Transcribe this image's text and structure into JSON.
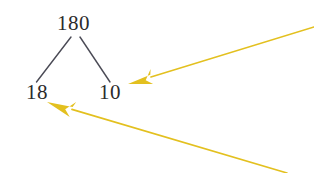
{
  "figure": {
    "kind": "factor-tree-with-annotation-arrows",
    "background_color": "#ffffff",
    "tree": {
      "root": {
        "value": "180",
        "name": "root-node"
      },
      "children": [
        {
          "value": "18",
          "name": "left-child-node"
        },
        {
          "value": "10",
          "name": "right-child-node"
        }
      ],
      "branch_color": "#4a4a55",
      "branch_width": 1.4,
      "branches": [
        {
          "name": "left-branch",
          "x1": 71,
          "y1": 37,
          "x2": 36.5,
          "y2": 82
        },
        {
          "name": "right-branch",
          "x1": 80,
          "y1": 37,
          "x2": 110,
          "y2": 82
        }
      ]
    },
    "arrows": {
      "color": "#e3c01f",
      "stroke_width": 1.6,
      "items": [
        {
          "name": "arrow-to-right-child",
          "tail_x": 314,
          "tail_y": 27,
          "tip_x": 128,
          "tip_y": 84,
          "head_length": 24,
          "head_width": 15
        },
        {
          "name": "arrow-to-left-child",
          "tail_x": 287,
          "tail_y": 173,
          "tip_x": 47,
          "tip_y": 102,
          "head_length": 26,
          "head_width": 16
        }
      ]
    }
  }
}
